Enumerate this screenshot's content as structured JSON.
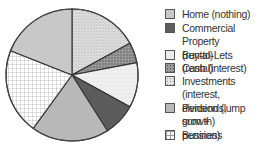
{
  "chart_data": {
    "type": "pie",
    "title": "",
    "start_angle_deg": 0,
    "direction": "clockwise",
    "slices": [
      {
        "label": "Investments (interest, dividends, growth)",
        "value": 17,
        "fill": "#d4d4d4",
        "pattern": "dots"
      },
      {
        "label": "Cash (interest)",
        "value": 5,
        "fill": "#8e8e8e",
        "pattern": "speckle"
      },
      {
        "label": "Buy-to-Lets (rental)",
        "value": 11,
        "fill": "#ececec",
        "pattern": "light-speckle"
      },
      {
        "label": "Commercial Property (rental)",
        "value": 8,
        "fill": "#5c5c5c",
        "pattern": "solid"
      },
      {
        "label": "Pension (lump sum + pension)",
        "value": 19,
        "fill": "#b8b8b8",
        "pattern": "solid"
      },
      {
        "label": "Business",
        "value": 21,
        "fill": "#ffffff",
        "pattern": "grid"
      },
      {
        "label": "Home (nothing)",
        "value": 19,
        "fill": "#c8c8c8",
        "pattern": "solid"
      }
    ],
    "legend_position": "right"
  },
  "legend": {
    "items": [
      {
        "line1": "Home (nothing)",
        "line2": "",
        "top": 2,
        "fill": "#c8c8c8",
        "pattern": "solid"
      },
      {
        "line1": "Commercial Property",
        "line2": "(rental)",
        "top": 16,
        "fill": "#5c5c5c",
        "pattern": "solid"
      },
      {
        "line1": "Buy-to-Lets (rental)",
        "line2": "",
        "top": 43,
        "fill": "#ececec",
        "pattern": "solid"
      },
      {
        "line1": "Cash (interest)",
        "line2": "",
        "top": 56,
        "fill": "#8e8e8e",
        "pattern": "speckle"
      },
      {
        "line1": "Investments (interest,",
        "line2": "dividends, growth)",
        "top": 69,
        "fill": "#d4d4d4",
        "pattern": "dots"
      },
      {
        "line1": "Pension (lump sum +",
        "line2": "pension)",
        "top": 96,
        "fill": "#b8b8b8",
        "pattern": "solid"
      },
      {
        "line1": "Business",
        "line2": "",
        "top": 123,
        "fill": "#ffffff",
        "pattern": "grid"
      }
    ]
  }
}
